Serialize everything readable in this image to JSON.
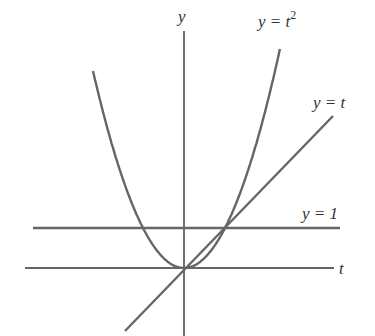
{
  "chart_data": {
    "type": "line",
    "title": "",
    "xlabel": "t",
    "ylabel": "y",
    "grid": false,
    "legend": "inline labels",
    "series": [
      {
        "name": "y = t^2",
        "label": "y = t",
        "label_sup": "2",
        "function": "t^2",
        "x": [
          -2.2,
          -2,
          -1.5,
          -1,
          -0.5,
          0,
          0.5,
          1,
          1.5,
          2,
          2.3
        ],
        "values": [
          4.84,
          4,
          2.25,
          1,
          0.25,
          0,
          0.25,
          1,
          2.25,
          4,
          5.29
        ]
      },
      {
        "name": "y = t",
        "label": "y = t",
        "function": "t",
        "x": [
          -1.45,
          3.6
        ],
        "values": [
          -1.45,
          3.6
        ]
      },
      {
        "name": "y = 1",
        "label": "y = 1",
        "function": "1",
        "x": [
          -3.7,
          3.8
        ],
        "values": [
          1,
          1
        ]
      }
    ],
    "axes": {
      "x_label": "t",
      "y_label": "y"
    },
    "intersections": [
      [
        0,
        0
      ],
      [
        1,
        1
      ]
    ],
    "colors": {
      "curves": "#666666",
      "axes": "#333333",
      "text": "#333333"
    }
  }
}
